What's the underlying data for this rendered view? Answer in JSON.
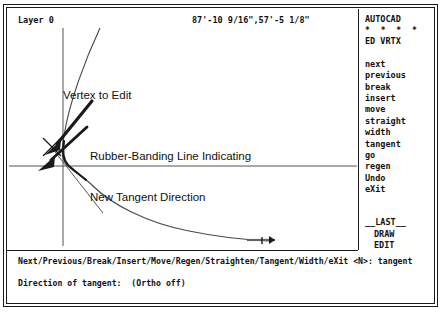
{
  "window": {
    "title": "AutoCAD PEDIT Vertex Editing"
  },
  "status_bar": {
    "layer_label": "Layer 0",
    "coordinates": "87'-10 9/16\",57'-5 1/8\""
  },
  "side_menu": {
    "header": "AUTOCAD",
    "stars": "* * * *",
    "mode": "ED VRTX",
    "items": [
      "next",
      "previous",
      "break",
      "insert",
      "move",
      "straight",
      "width",
      "tangent",
      "go",
      "regen",
      "Undo",
      "eXit"
    ],
    "footer_items": [
      "__LAST__",
      "DRAW",
      "EDIT"
    ]
  },
  "command_area": {
    "prompt": "Next/Previous/Break/Insert/Move/Regen/Straighten/Tangent/Width/eXit <N>: tangent",
    "status": "Direction of tangent:  (Ortho off)"
  },
  "annotations": {
    "vertex_label": "Vertex to Edit",
    "rubber_line_1": "Rubber-Banding Line Indicating",
    "rubber_line_2": "New Tangent Direction"
  },
  "colors": {
    "ink": "#1a1a1a",
    "line": "#444444",
    "background": "#ffffff"
  }
}
